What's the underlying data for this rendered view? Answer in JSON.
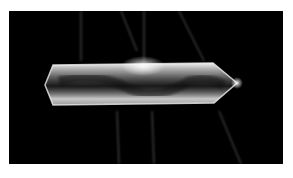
{
  "image": {
    "subject": "glowing elongated crystal on black background",
    "background_color": "#000000",
    "page_background": "#ffffff",
    "glow_color": "#ffffff"
  }
}
